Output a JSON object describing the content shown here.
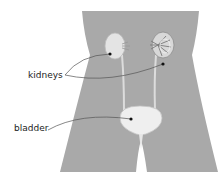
{
  "diagram": {
    "labels": {
      "kidneys": "kidneys",
      "bladder": "bladder"
    },
    "parts": [
      "body-silhouette",
      "left-kidney",
      "right-kidney",
      "left-ureter",
      "right-ureter",
      "bladder",
      "urethra"
    ],
    "colors": {
      "body": "#a9a9a9",
      "organ": "#e8e8e8",
      "organ_shade": "#c9c9c9",
      "leader_line": "#555555",
      "dot": "#111111",
      "text": "#222222"
    }
  }
}
